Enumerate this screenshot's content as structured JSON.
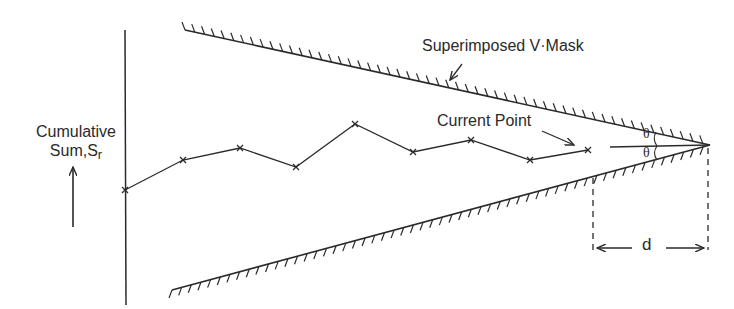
{
  "diagram": {
    "y_axis_label": "Cumulative",
    "y_axis_label_line2": "Sum,S",
    "y_axis_label_subscript": "r",
    "mask_label": "Superimposed V·Mask",
    "current_point_label": "Current Point",
    "angle_label_upper": "θ",
    "angle_label_lower": "θ",
    "lead_distance_label": "d",
    "colors": {
      "ink": "#2a2a2a",
      "background": "#ffffff"
    }
  },
  "chart_data": {
    "type": "line",
    "xlabel": "",
    "ylabel": "Cumulative Sum, S_r",
    "series": [
      {
        "name": "Cumulative Sum",
        "points_px": [
          [
            125,
            190
          ],
          [
            183,
            160
          ],
          [
            240,
            148
          ],
          [
            296,
            167
          ],
          [
            355,
            124
          ],
          [
            413,
            152
          ],
          [
            471,
            140
          ],
          [
            530,
            160
          ],
          [
            588,
            150
          ]
        ]
      }
    ],
    "v_mask": {
      "vertex_px": [
        710,
        145
      ],
      "upper_arm_start_px": [
        185,
        30
      ],
      "lower_arm_start_px": [
        172,
        290
      ],
      "angle_label": "θ",
      "lead_distance_label": "d",
      "lead_distance_px": [
        593,
        708
      ]
    },
    "annotations": [
      "Superimposed V·Mask",
      "Current Point",
      "θ",
      "θ",
      "d"
    ],
    "grid": false
  }
}
